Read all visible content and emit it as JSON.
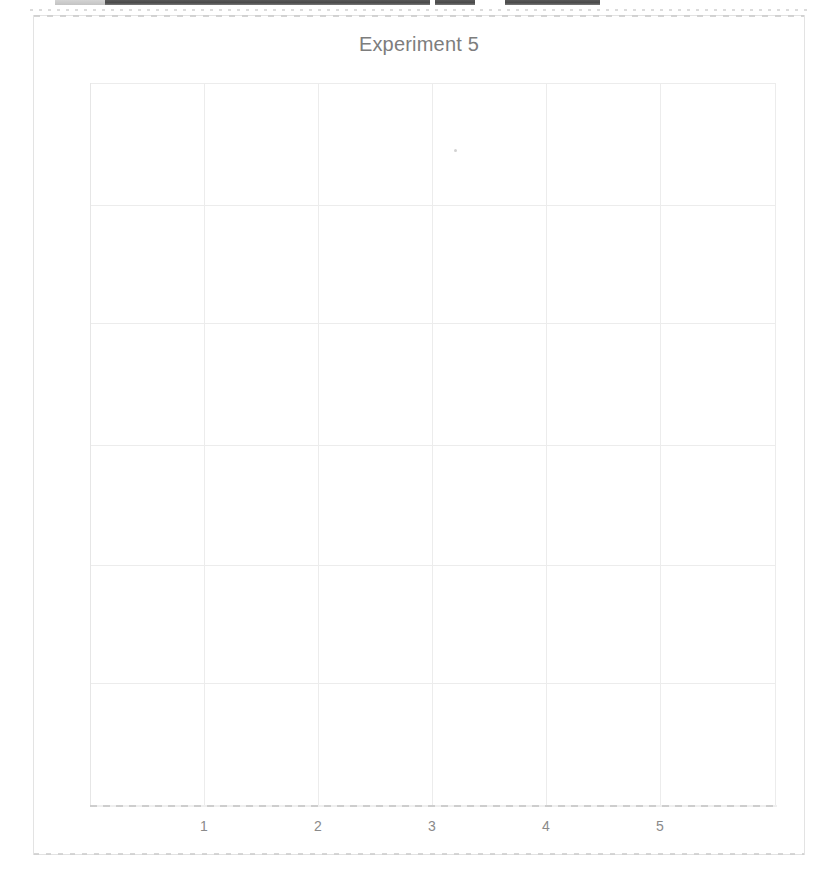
{
  "document": {
    "kind": "scanned-figure-page",
    "background_color": "#ffffff"
  },
  "scan_artifacts": {
    "top_strip_label": "cut-off-text-bars",
    "bars": [
      {
        "left": 55,
        "width": 50,
        "faint": true
      },
      {
        "left": 105,
        "width": 325,
        "faint": false
      },
      {
        "left": 435,
        "width": 40,
        "faint": false
      },
      {
        "left": 505,
        "width": 95,
        "faint": false
      }
    ],
    "speck": {
      "x": 454,
      "y": 149,
      "color": "#d2d2d2"
    }
  },
  "figure": {
    "frame_color": "#e3e3e3",
    "title": "Experiment 5",
    "title_color": "#7d7d7d"
  },
  "chart_data": {
    "type": "scatter",
    "title": "Experiment 5",
    "xlabel": "",
    "ylabel": "",
    "x_tick_labels": [
      "1",
      "2",
      "3",
      "4",
      "5"
    ],
    "x_tick_positions": [
      204,
      318,
      432,
      546,
      660
    ],
    "y_tick_labels": [],
    "xlim": [
      0.5,
      5.5
    ],
    "grid": true,
    "grid_color": "#ececec",
    "legend": null,
    "series": [],
    "values": [],
    "categories": [],
    "note": "Plot area is empty - no data points, lines, bars or markers are rendered.",
    "gridlines": {
      "vertical_x": [
        90,
        204,
        318,
        432,
        546,
        660,
        775
      ],
      "horizontal_y": [
        83,
        205,
        323,
        445,
        565,
        683,
        805
      ]
    },
    "plot_box": {
      "left": 90,
      "top": 83,
      "right": 775,
      "bottom": 805
    }
  }
}
